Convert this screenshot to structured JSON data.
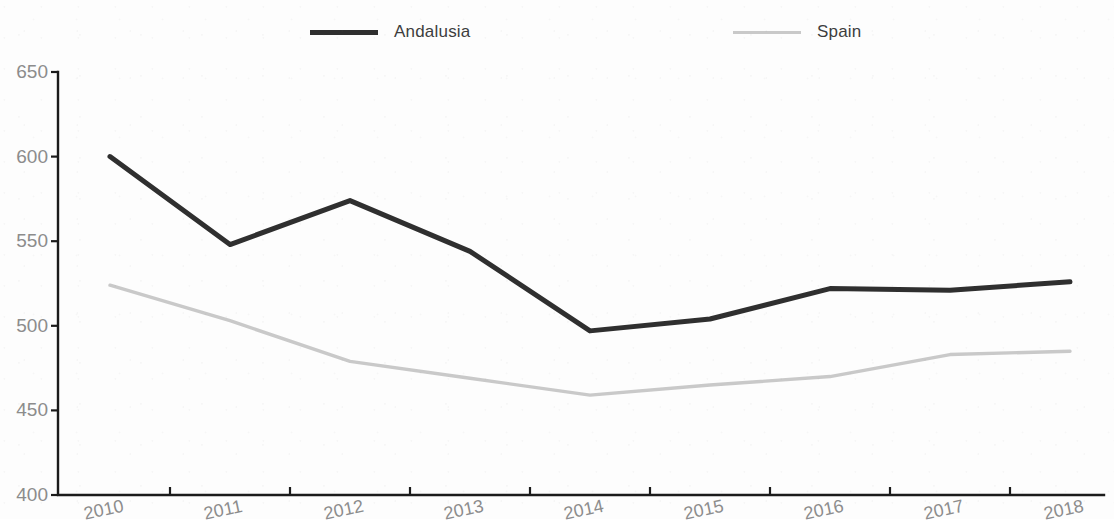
{
  "chart_data": {
    "type": "line",
    "title": "",
    "xlabel": "",
    "ylabel": "",
    "categories": [
      "2010",
      "2011",
      "2012",
      "2013",
      "2014",
      "2015",
      "2016",
      "2017",
      "2018"
    ],
    "ylim": [
      400,
      650
    ],
    "y_ticks": [
      400,
      450,
      500,
      550,
      600,
      650
    ],
    "grid": false,
    "legend_position": "top",
    "series": [
      {
        "name": "Andalusia",
        "color": "#2f2f2f",
        "values": [
          600,
          548,
          574,
          544,
          497,
          504,
          522,
          521,
          526
        ]
      },
      {
        "name": "Spain",
        "color": "#c9c9c9",
        "values": [
          524,
          503,
          479,
          469,
          459,
          465,
          470,
          483,
          485
        ]
      }
    ]
  },
  "legend": {
    "items": [
      {
        "label": "Andalusia"
      },
      {
        "label": "Spain"
      }
    ]
  },
  "axes": {
    "y_labels": [
      "650",
      "600",
      "550",
      "500",
      "450",
      "400"
    ],
    "x_labels": [
      "2010",
      "2011",
      "2012",
      "2013",
      "2014",
      "2015",
      "2016",
      "2017",
      "2018"
    ]
  }
}
